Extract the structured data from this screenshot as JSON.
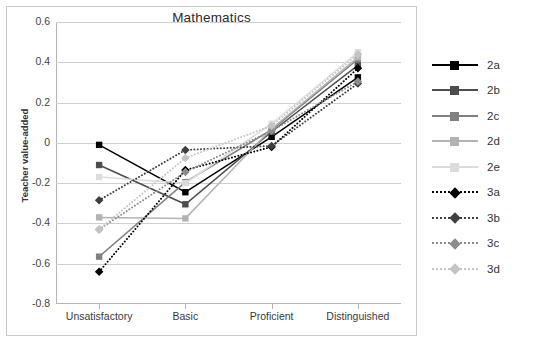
{
  "chart_data": {
    "type": "line",
    "title": "Mathematics",
    "xlabel": "",
    "ylabel": "Teacher value-added",
    "categories": [
      "Unsatisfactory",
      "Basic",
      "Proficient",
      "Distinguished"
    ],
    "ylim": [
      -0.8,
      0.6
    ],
    "yticks": [
      "0.6",
      "0.4",
      "0.2",
      "0",
      "-0.2",
      "-0.4",
      "-0.6",
      "-0.8"
    ],
    "ytick_values": [
      0.6,
      0.4,
      0.2,
      0,
      -0.2,
      -0.4,
      -0.6,
      -0.8
    ],
    "grid": true,
    "legend_position": "right",
    "series": [
      {
        "name": "2a",
        "style": "solid",
        "marker": "square",
        "color": "#000000",
        "values": [
          -0.01,
          -0.245,
          0.03,
          0.325
        ]
      },
      {
        "name": "2b",
        "style": "solid",
        "marker": "square",
        "color": "#4d4d4d",
        "values": [
          -0.11,
          -0.305,
          0.055,
          0.385
        ]
      },
      {
        "name": "2c",
        "style": "solid",
        "marker": "square",
        "color": "#808080",
        "values": [
          -0.565,
          -0.195,
          0.065,
          0.415
        ]
      },
      {
        "name": "2d",
        "style": "solid",
        "marker": "square",
        "color": "#b3b3b3",
        "values": [
          -0.37,
          -0.375,
          0.07,
          0.425
        ]
      },
      {
        "name": "2e",
        "style": "solid",
        "marker": "square",
        "color": "#dcdcdc",
        "values": [
          -0.17,
          -0.2,
          0.095,
          0.45
        ]
      },
      {
        "name": "3a",
        "style": "dotted",
        "marker": "diamond",
        "color": "#000000",
        "values": [
          -0.64,
          -0.135,
          -0.02,
          0.37
        ]
      },
      {
        "name": "3b",
        "style": "dotted",
        "marker": "diamond",
        "color": "#3f3f3f",
        "values": [
          -0.285,
          -0.035,
          -0.015,
          0.295
        ]
      },
      {
        "name": "3c",
        "style": "dotted",
        "marker": "diamond",
        "color": "#8c8c8c",
        "values": [
          -0.43,
          -0.145,
          0.06,
          0.305
        ]
      },
      {
        "name": "3d",
        "style": "dotted",
        "marker": "diamond",
        "color": "#c4c4c4",
        "values": [
          -0.43,
          -0.075,
          0.085,
          0.44
        ]
      }
    ]
  },
  "legend": {
    "items": [
      {
        "label": "2a"
      },
      {
        "label": "2b"
      },
      {
        "label": "2c"
      },
      {
        "label": "2d"
      },
      {
        "label": "2e"
      },
      {
        "label": "3a"
      },
      {
        "label": "3b"
      },
      {
        "label": "3c"
      },
      {
        "label": "3d"
      }
    ]
  },
  "colors": {
    "grid": "#cfcfcf",
    "axis": "#b5b5b5",
    "frame": "#c9c9c9",
    "text": "#333333",
    "background": "#ffffff"
  }
}
